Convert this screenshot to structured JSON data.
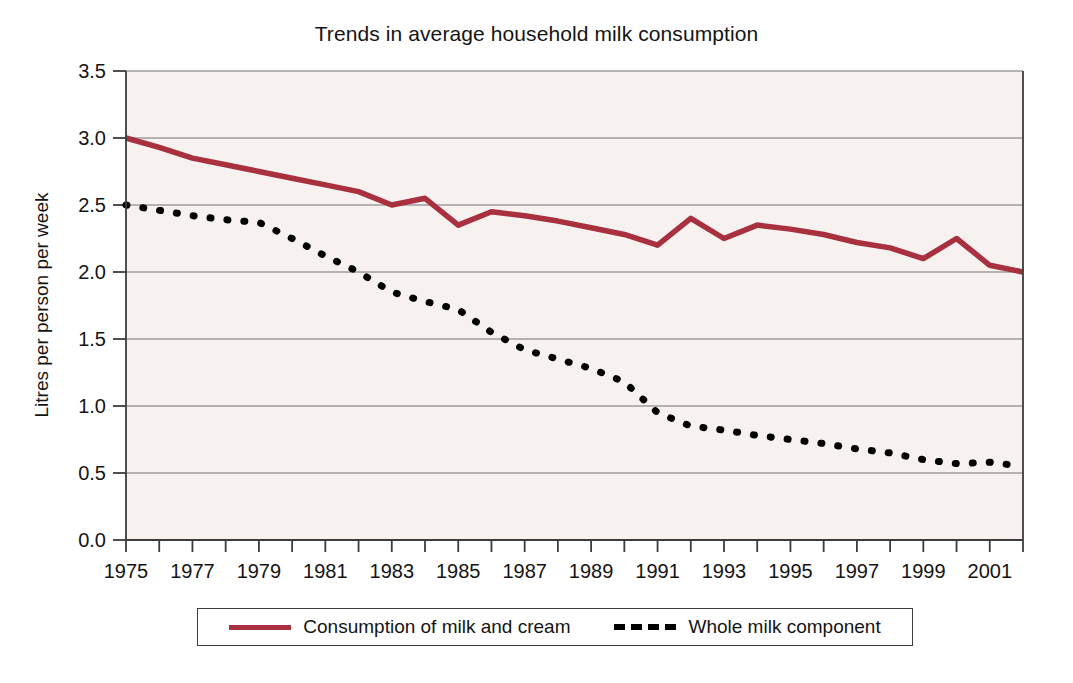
{
  "chart_data": {
    "type": "line",
    "title": "Trends in average household milk consumption",
    "xlabel": "",
    "ylabel": "Litres per person per week",
    "xlim": [
      1975,
      2002
    ],
    "ylim": [
      0.0,
      3.5
    ],
    "grid": true,
    "legend_position": "bottom",
    "x": [
      1975,
      1976,
      1977,
      1978,
      1979,
      1980,
      1981,
      1982,
      1983,
      1984,
      1985,
      1986,
      1987,
      1988,
      1989,
      1990,
      1991,
      1992,
      1993,
      1994,
      1995,
      1996,
      1997,
      1998,
      1999,
      2000,
      2001,
      2002
    ],
    "x_tick_labels": [
      "1975",
      "1977",
      "1979",
      "1981",
      "1983",
      "1985",
      "1987",
      "1989",
      "1991",
      "1993",
      "1995",
      "1997",
      "1999",
      "2001"
    ],
    "x_tick_values": [
      1975,
      1977,
      1979,
      1981,
      1983,
      1985,
      1987,
      1989,
      1991,
      1993,
      1995,
      1997,
      1999,
      2001
    ],
    "y_tick_labels": [
      "0.0",
      "0.5",
      "1.0",
      "1.5",
      "2.0",
      "2.5",
      "3.0",
      "3.5"
    ],
    "y_tick_values": [
      0.0,
      0.5,
      1.0,
      1.5,
      2.0,
      2.5,
      3.0,
      3.5
    ],
    "series": [
      {
        "name": "Consumption of milk and cream",
        "color": "#a8303f",
        "style": "solid",
        "values": [
          3.0,
          2.93,
          2.85,
          2.8,
          2.75,
          2.7,
          2.65,
          2.6,
          2.5,
          2.55,
          2.35,
          2.45,
          2.42,
          2.38,
          2.33,
          2.28,
          2.2,
          2.4,
          2.25,
          2.35,
          2.32,
          2.28,
          2.22,
          2.18,
          2.1,
          2.25,
          2.05,
          2.0
        ]
      },
      {
        "name": "Whole milk component",
        "color": "#000000",
        "style": "dashed",
        "values": [
          2.5,
          2.46,
          2.42,
          2.39,
          2.37,
          2.25,
          2.12,
          2.0,
          1.85,
          1.78,
          1.72,
          1.55,
          1.42,
          1.35,
          1.28,
          1.18,
          0.95,
          0.85,
          0.82,
          0.78,
          0.75,
          0.72,
          0.68,
          0.65,
          0.6,
          0.57,
          0.58,
          0.55
        ]
      }
    ]
  },
  "legend": {
    "items": [
      {
        "label": "Consumption of milk and cream",
        "swatch": "solid-red"
      },
      {
        "label": "Whole milk component",
        "swatch": "dashed-black"
      }
    ]
  }
}
